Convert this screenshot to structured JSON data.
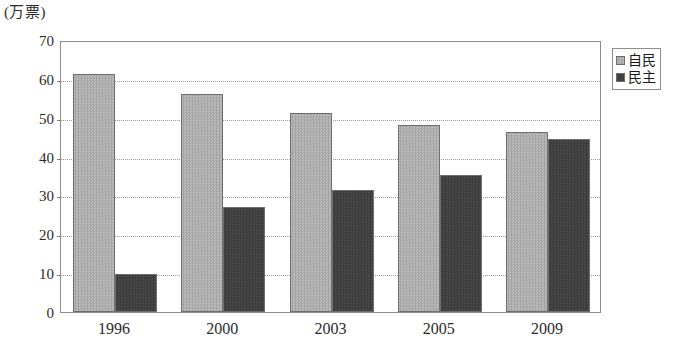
{
  "chart_data": {
    "type": "bar",
    "title": "",
    "subtitle": "",
    "unit_label": "(万票)",
    "xlabel": "",
    "ylabel": "",
    "categories": [
      "1996",
      "2000",
      "2003",
      "2005",
      "2009"
    ],
    "series": [
      {
        "name": "自民",
        "color": "#b0b0b0",
        "values": [
          61.2,
          56.1,
          51.3,
          48.2,
          46.2
        ]
      },
      {
        "name": "民主",
        "color": "#404040",
        "values": [
          9.8,
          26.9,
          31.4,
          35.2,
          44.4
        ]
      }
    ],
    "ylim": [
      0,
      70
    ],
    "ytick_step": 10,
    "yticks": [
      "0",
      "10",
      "20",
      "30",
      "40",
      "50",
      "60",
      "70"
    ],
    "grid": true,
    "grid_style": "dotted-horizontal",
    "legend_position": "right-top",
    "legend_entries": [
      "自民",
      "民主"
    ]
  }
}
